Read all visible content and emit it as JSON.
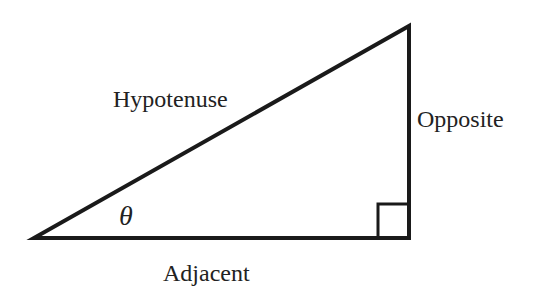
{
  "diagram": {
    "labels": {
      "hypotenuse": "Hypotenuse",
      "opposite": "Opposite",
      "adjacent": "Adjacent",
      "angle": "θ"
    },
    "colors": {
      "stroke": "#1a1a1a",
      "text": "#222222",
      "background": "#ffffff"
    }
  }
}
